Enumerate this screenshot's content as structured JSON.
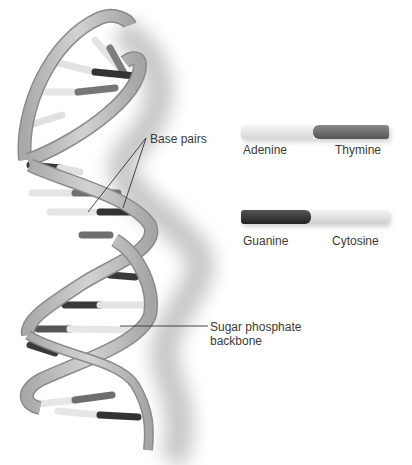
{
  "labels": {
    "base_pairs": "Base pairs",
    "backbone_line1": "Sugar phosphate",
    "backbone_line2": "backbone"
  },
  "legend": [
    {
      "left": {
        "name": "Adenine",
        "color": "#e6e6e6"
      },
      "right": {
        "name": "Thymine",
        "color": "#6e6e6e"
      }
    },
    {
      "left": {
        "name": "Guanine",
        "color": "#3a3a3a"
      },
      "right": {
        "name": "Cytosine",
        "color": "#dcdcdc"
      }
    }
  ],
  "colors": {
    "backbone": "#bdbdbd",
    "backbone_edge": "#8a8a8a",
    "shadow": "#cccccc",
    "leader_line": "#333333"
  }
}
